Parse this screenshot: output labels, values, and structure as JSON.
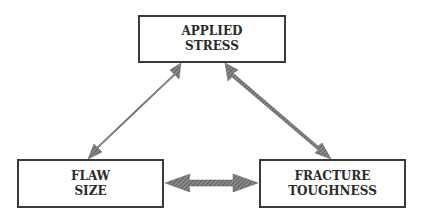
{
  "diagram": {
    "nodes": [
      {
        "id": "applied-stress",
        "lines": [
          "APPLIED",
          "STRESS"
        ]
      },
      {
        "id": "flaw-size",
        "lines": [
          "FLAW",
          "SIZE"
        ]
      },
      {
        "id": "fracture-toughness",
        "lines": [
          "FRACTURE",
          "TOUGHNESS"
        ]
      }
    ],
    "edges": [
      {
        "from": "applied-stress",
        "to": "flaw-size",
        "type": "bidirectional"
      },
      {
        "from": "applied-stress",
        "to": "fracture-toughness",
        "type": "bidirectional"
      },
      {
        "from": "flaw-size",
        "to": "fracture-toughness",
        "type": "bidirectional"
      }
    ],
    "colors": {
      "border": "#3a3a3a",
      "arrow": "#6e6e6e",
      "text": "#2a2a2a"
    }
  }
}
